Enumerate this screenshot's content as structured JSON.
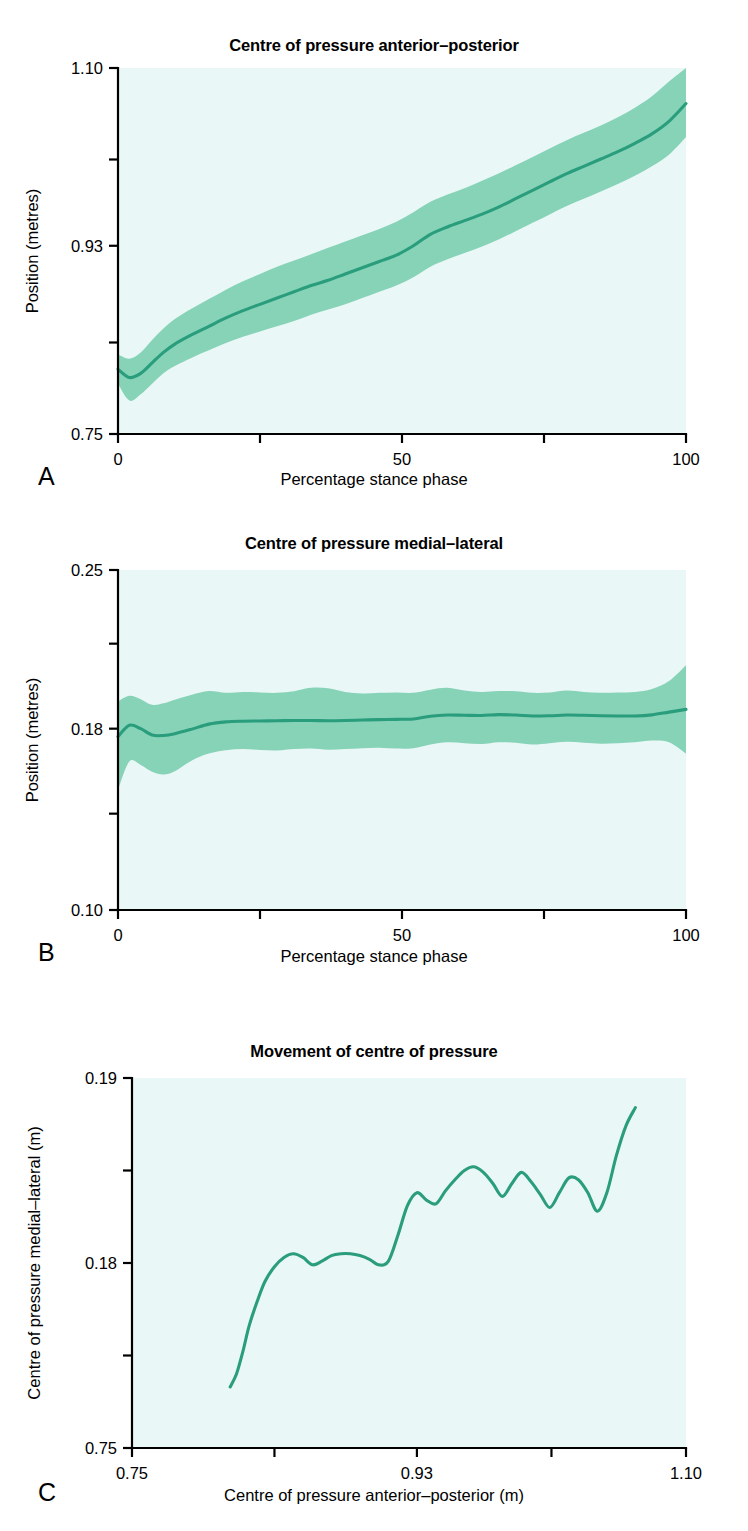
{
  "figure": {
    "background_color": "#ffffff",
    "plot_background_color": "#eaf7f7",
    "band_color": "#86d3b7",
    "line_color": "#2a9d7c"
  },
  "panels": [
    {
      "letter": "A",
      "title": "Centre of pressure anterior–posterior",
      "xlabel": "Percentage stance phase",
      "ylabel": "Position (metres)",
      "xticklabels": [
        "0",
        "50",
        "100"
      ],
      "yticklabels": [
        "0.75",
        "0.93",
        "1.10"
      ]
    },
    {
      "letter": "B",
      "title": "Centre of pressure medial–lateral",
      "xlabel": "Percentage stance phase",
      "ylabel": "Position (metres)",
      "xticklabels": [
        "0",
        "50",
        "100"
      ],
      "yticklabels": [
        "0.10",
        "0.18",
        "0.25"
      ]
    },
    {
      "letter": "C",
      "title": "Movement of centre of pressure",
      "xlabel": "Centre of pressure anterior–posterior (m)",
      "ylabel": "Centre of pressure medial–lateral (m)",
      "xticklabels": [
        "0.75",
        "0.93",
        "1.10"
      ],
      "yticklabels": [
        "0.75",
        "0.18",
        "0.19"
      ]
    }
  ],
  "chart_data": [
    {
      "id": "panel-a",
      "type": "line",
      "title": "Centre of pressure anterior–posterior",
      "xlabel": "Percentage stance phase",
      "ylabel": "Position (metres)",
      "xlim": [
        0,
        100
      ],
      "ylim": [
        0.75,
        1.1
      ],
      "xticks": [
        0,
        50,
        100
      ],
      "xtick_labels": [
        "0",
        "50",
        "100"
      ],
      "xminorticks": [
        25,
        75
      ],
      "yticks": [
        0.75,
        0.93,
        1.1
      ],
      "ytick_labels": [
        "0.75",
        "0.93",
        "1.10"
      ],
      "yminorticks": [
        0.8375,
        1.0125
      ],
      "grid": false,
      "legend": false,
      "band": "mean ± 1 SD shaded",
      "x": [
        0,
        2,
        4,
        6,
        8,
        10,
        13,
        16,
        19,
        22,
        25,
        28,
        31,
        34,
        37,
        40,
        43,
        46,
        49,
        52,
        55,
        58,
        61,
        64,
        67,
        70,
        73,
        76,
        79,
        82,
        85,
        88,
        91,
        94,
        97,
        100
      ],
      "mean": [
        0.812,
        0.804,
        0.808,
        0.818,
        0.828,
        0.836,
        0.845,
        0.853,
        0.861,
        0.868,
        0.874,
        0.88,
        0.886,
        0.892,
        0.897,
        0.903,
        0.909,
        0.915,
        0.921,
        0.93,
        0.941,
        0.948,
        0.954,
        0.96,
        0.967,
        0.975,
        0.983,
        0.991,
        0.999,
        1.006,
        1.013,
        1.02,
        1.028,
        1.037,
        1.049,
        1.066
      ],
      "upper": [
        0.826,
        0.822,
        0.828,
        0.84,
        0.851,
        0.86,
        0.87,
        0.879,
        0.888,
        0.896,
        0.903,
        0.91,
        0.916,
        0.922,
        0.928,
        0.934,
        0.94,
        0.946,
        0.953,
        0.962,
        0.972,
        0.979,
        0.985,
        0.992,
        0.999,
        1.007,
        1.015,
        1.023,
        1.031,
        1.038,
        1.045,
        1.053,
        1.062,
        1.073,
        1.087,
        1.1
      ],
      "lower": [
        0.798,
        0.782,
        0.788,
        0.798,
        0.808,
        0.815,
        0.823,
        0.83,
        0.837,
        0.843,
        0.848,
        0.853,
        0.858,
        0.864,
        0.869,
        0.874,
        0.88,
        0.886,
        0.892,
        0.9,
        0.91,
        0.917,
        0.923,
        0.929,
        0.936,
        0.944,
        0.952,
        0.96,
        0.968,
        0.975,
        0.982,
        0.989,
        0.997,
        1.006,
        1.017,
        1.034
      ]
    },
    {
      "id": "panel-b",
      "type": "line",
      "title": "Centre of pressure medial–lateral",
      "xlabel": "Percentage stance phase",
      "ylabel": "Position (metres)",
      "xlim": [
        0,
        100
      ],
      "ylim": [
        0.1,
        0.25
      ],
      "xticks": [
        0,
        50,
        100
      ],
      "xtick_labels": [
        "0",
        "50",
        "100"
      ],
      "xminorticks": [
        25,
        75
      ],
      "yticks": [
        0.1,
        0.18,
        0.25
      ],
      "ytick_labels": [
        "0.10",
        "0.18",
        "0.25"
      ],
      "yminorticks": [
        0.1425,
        0.2175
      ],
      "grid": false,
      "legend": false,
      "band": "mean ± 1 SD shaded",
      "x": [
        0,
        2,
        4,
        6,
        8,
        10,
        13,
        16,
        19,
        22,
        25,
        28,
        31,
        34,
        37,
        40,
        43,
        46,
        49,
        52,
        55,
        58,
        61,
        64,
        67,
        70,
        73,
        76,
        79,
        82,
        85,
        88,
        91,
        94,
        97,
        100
      ],
      "mean": [
        0.1765,
        0.1815,
        0.18,
        0.1772,
        0.177,
        0.1778,
        0.1798,
        0.182,
        0.183,
        0.1833,
        0.1834,
        0.1835,
        0.1836,
        0.1836,
        0.1835,
        0.1836,
        0.1838,
        0.184,
        0.1841,
        0.1843,
        0.1855,
        0.186,
        0.1859,
        0.1858,
        0.1862,
        0.186,
        0.1856,
        0.1857,
        0.186,
        0.1859,
        0.1857,
        0.1856,
        0.1856,
        0.1861,
        0.1873,
        0.1885
      ],
      "upper": [
        0.192,
        0.1945,
        0.193,
        0.1905,
        0.1912,
        0.1928,
        0.195,
        0.1966,
        0.1958,
        0.1962,
        0.196,
        0.1958,
        0.1965,
        0.198,
        0.1978,
        0.1962,
        0.1955,
        0.1958,
        0.196,
        0.1958,
        0.1972,
        0.198,
        0.1968,
        0.1962,
        0.1966,
        0.1965,
        0.1958,
        0.196,
        0.1968,
        0.1962,
        0.1958,
        0.196,
        0.1962,
        0.1975,
        0.201,
        0.208
      ],
      "lower": [
        0.153,
        0.1655,
        0.164,
        0.161,
        0.1598,
        0.1612,
        0.166,
        0.169,
        0.1705,
        0.171,
        0.1706,
        0.1704,
        0.171,
        0.1712,
        0.1707,
        0.171,
        0.1714,
        0.1716,
        0.1712,
        0.1714,
        0.173,
        0.174,
        0.1736,
        0.1732,
        0.174,
        0.1738,
        0.173,
        0.1736,
        0.1742,
        0.1738,
        0.1734,
        0.1736,
        0.174,
        0.1748,
        0.174,
        0.169
      ]
    },
    {
      "id": "panel-c",
      "type": "line",
      "title": "Movement of centre of pressure",
      "xlabel": "Centre of pressure anterior–posterior (m)",
      "ylabel": "Centre of pressure medial–lateral (m)",
      "xlim": [
        0.75,
        1.1
      ],
      "ylim": [
        0.17,
        0.19
      ],
      "xticks": [
        0.75,
        0.93,
        1.1
      ],
      "xtick_labels": [
        "0.75",
        "0.93",
        "1.10"
      ],
      "xminorticks": [
        0.84,
        1.015
      ],
      "yticks": [
        0.17,
        0.18,
        0.19
      ],
      "ytick_labels": [
        "0.75",
        "0.18",
        "0.19"
      ],
      "yminorticks": [
        0.175,
        0.185
      ],
      "grid": false,
      "legend": false,
      "x": [
        0.812,
        0.816,
        0.82,
        0.824,
        0.829,
        0.834,
        0.84,
        0.846,
        0.852,
        0.858,
        0.864,
        0.87,
        0.876,
        0.882,
        0.888,
        0.894,
        0.9,
        0.906,
        0.912,
        0.918,
        0.924,
        0.93,
        0.936,
        0.942,
        0.948,
        0.954,
        0.96,
        0.966,
        0.972,
        0.978,
        0.984,
        0.99,
        0.996,
        1.002,
        1.008,
        1.014,
        1.02,
        1.026,
        1.032,
        1.038,
        1.044,
        1.05,
        1.056,
        1.062,
        1.068
      ],
      "y": [
        0.1733,
        0.174,
        0.1752,
        0.1766,
        0.1779,
        0.179,
        0.1798,
        0.1803,
        0.1805,
        0.1803,
        0.1799,
        0.1801,
        0.1804,
        0.1805,
        0.1805,
        0.1804,
        0.1802,
        0.1799,
        0.1801,
        0.1815,
        0.1831,
        0.1838,
        0.1834,
        0.1832,
        0.1839,
        0.1845,
        0.185,
        0.1852,
        0.1849,
        0.1843,
        0.1836,
        0.1843,
        0.1849,
        0.1844,
        0.1837,
        0.183,
        0.1838,
        0.1846,
        0.1845,
        0.1838,
        0.1828,
        0.1838,
        0.1858,
        0.1874,
        0.1884
      ]
    }
  ]
}
